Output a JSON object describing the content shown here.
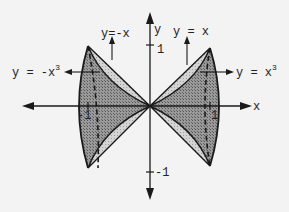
{
  "diagram": {
    "type": "solid-of-revolution-sketch",
    "axes": {
      "x_label": "x",
      "y_label": "y",
      "y_tick_pos_label": "1",
      "y_tick_neg_label": "-1",
      "x_tick_pos_label": "1",
      "x_tick_neg_label": "-1"
    },
    "curves": [
      {
        "name": "line-y-eq-x",
        "label": "y = x"
      },
      {
        "name": "line-y-eq-neg-x",
        "label": "y=-x"
      },
      {
        "name": "cubic-y-eq-x3",
        "label_base": "y = x",
        "label_exp": "3"
      },
      {
        "name": "cubic-y-eq-neg-x3",
        "label_base": "y = -x",
        "label_exp": "3"
      }
    ],
    "colors": {
      "background": "#f3f3f3",
      "stroke": "#1a1a1a",
      "dark_fill": "#8a8a8a",
      "light_fill": "#c8c8c8"
    }
  }
}
